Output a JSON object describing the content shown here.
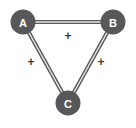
{
  "figure": {
    "type": "signed-graph-diagram",
    "background_color": "#ffffff",
    "node_color": "#58585a",
    "node_label_color": "#ffffff",
    "edge_color": "#58585a",
    "edge_inner_color": "#e4e4e4",
    "sign_label_color": "#3c3c3e",
    "width": 136,
    "height": 128
  },
  "nodes": [
    {
      "id": "A",
      "label": "A",
      "cx": 23,
      "cy": 22,
      "r": 12.5
    },
    {
      "id": "B",
      "label": "B",
      "cx": 113,
      "cy": 22,
      "r": 12.5
    },
    {
      "id": "C",
      "label": "C",
      "cx": 68,
      "cy": 103,
      "r": 12.5
    }
  ],
  "edges": [
    {
      "id": "A-B",
      "source": "A",
      "target": "B",
      "sign": "+",
      "sign_x": 68,
      "sign_y": 36
    },
    {
      "id": "A-C",
      "source": "A",
      "target": "C",
      "sign": "+",
      "sign_x": 31,
      "sign_y": 62
    },
    {
      "id": "B-C",
      "source": "B",
      "target": "C",
      "sign": "+",
      "sign_x": 101,
      "sign_y": 62
    }
  ]
}
